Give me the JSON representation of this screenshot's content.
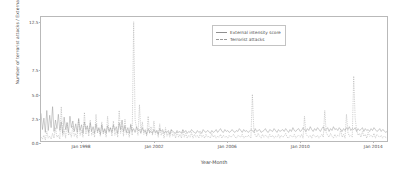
{
  "chart_data": {
    "type": "line",
    "title": "",
    "xlabel": "Year-Month",
    "ylabel": "Number of terrorist attacks / External intensity score",
    "ylim": [
      0.0,
      13.0
    ],
    "yticks": [
      "0.0",
      "2.5",
      "5.0",
      "7.5",
      "12.5"
    ],
    "ytick_values": [
      0.0,
      2.5,
      5.0,
      7.5,
      12.5
    ],
    "xlim": [
      "Jan 1996",
      "Dec 2015"
    ],
    "xticks": [
      "Jan 1998",
      "Jan 2002",
      "Jan 2006",
      "Jan 2010",
      "Jan 2014"
    ],
    "xtick_positions": [
      0.115,
      0.325,
      0.535,
      0.745,
      0.955
    ],
    "grid": false,
    "legend_position": "upper right",
    "series": [
      {
        "name": "External intensity score",
        "style": "solid",
        "color": "#8f8f8f",
        "values": [
          2.9,
          1.2,
          2.4,
          0.9,
          3.2,
          1.1,
          2.7,
          1.4,
          3.6,
          1.0,
          2.2,
          1.3,
          2.8,
          1.1,
          2.0,
          0.8,
          2.5,
          1.2,
          1.9,
          0.9,
          2.6,
          1.4,
          2.1,
          1.0,
          1.8,
          0.9,
          2.3,
          1.1,
          1.7,
          0.8,
          2.0,
          1.2,
          1.6,
          0.9,
          1.9,
          1.0,
          1.5,
          0.8,
          1.8,
          1.0,
          1.4,
          0.7,
          1.7,
          0.9,
          1.3,
          0.8,
          1.6,
          1.0,
          1.4,
          0.9,
          1.7,
          1.1,
          1.5,
          0.8,
          1.9,
          1.2,
          2.2,
          1.0,
          1.6,
          0.9,
          1.4,
          0.8,
          1.7,
          1.0,
          1.3,
          0.9,
          1.5,
          1.1,
          1.2,
          0.8,
          1.4,
          1.0,
          1.1,
          0.7,
          1.3,
          0.9,
          1.0,
          0.8,
          1.2,
          0.9,
          1.1,
          0.7,
          1.3,
          1.0,
          1.2,
          0.8,
          1.0,
          0.9,
          1.1,
          0.7,
          1.2,
          1.0,
          0.9,
          0.8,
          1.1,
          0.9,
          1.0,
          0.8,
          1.2,
          0.9,
          1.1,
          0.8,
          1.0,
          0.9,
          1.2,
          1.0,
          0.9,
          0.8,
          1.1,
          0.9,
          1.0,
          0.8,
          1.2,
          1.0,
          0.9,
          1.1,
          1.0,
          0.8,
          1.1,
          0.9,
          1.0,
          1.2,
          0.9,
          1.1,
          1.3,
          1.0,
          0.9,
          1.2,
          1.0,
          1.1,
          0.9,
          1.0,
          1.2,
          1.0,
          0.9,
          1.1,
          1.0,
          1.3,
          1.1,
          0.9,
          1.2,
          1.0,
          1.1,
          0.9,
          1.0,
          1.2,
          1.1,
          0.9,
          1.3,
          1.0,
          1.1,
          1.2,
          0.9,
          1.0,
          1.1,
          1.3,
          1.0,
          0.9,
          1.2,
          1.1,
          1.0,
          1.3,
          1.1,
          0.9,
          1.2,
          1.0,
          1.1,
          1.2,
          1.0,
          1.3,
          1.1,
          0.9,
          1.2,
          1.0,
          1.4,
          1.1,
          1.0,
          1.2,
          1.3,
          1.0,
          1.1,
          1.4,
          1.2,
          1.0,
          1.3,
          1.1,
          1.5,
          1.2,
          1.0,
          1.3,
          1.1,
          1.4,
          1.2,
          1.0,
          1.3,
          1.5,
          1.1,
          1.2,
          1.4,
          1.0,
          1.3,
          1.1,
          1.5,
          1.2,
          1.3,
          1.1,
          1.4,
          1.2,
          1.0,
          1.3,
          1.1,
          1.4,
          1.2,
          1.5,
          1.1,
          1.3,
          1.2,
          1.4,
          1.0,
          1.3,
          1.1,
          1.2,
          1.4,
          1.0,
          1.3,
          1.1,
          1.2,
          1.0,
          1.3,
          1.1,
          1.4,
          1.2,
          1.0,
          1.1,
          1.3,
          1.0,
          1.2,
          1.1,
          0.9,
          1.0
        ]
      },
      {
        "name": "Terrorist attacks",
        "style": "dashed",
        "color": "#9a9a9a",
        "values": [
          0.4,
          0.2,
          0.6,
          0.1,
          1.0,
          0.3,
          0.5,
          0.2,
          0.8,
          0.3,
          1.4,
          0.4,
          0.6,
          0.2,
          3.6,
          0.5,
          1.2,
          0.3,
          2.0,
          0.6,
          0.9,
          0.4,
          1.6,
          0.5,
          0.8,
          0.3,
          2.4,
          0.6,
          1.1,
          0.4,
          3.0,
          0.7,
          1.5,
          0.5,
          2.2,
          0.6,
          1.0,
          0.4,
          2.8,
          0.8,
          1.3,
          0.5,
          2.0,
          0.7,
          1.2,
          0.4,
          2.6,
          0.9,
          1.4,
          0.5,
          2.1,
          0.6,
          1.1,
          0.4,
          3.2,
          0.8,
          1.6,
          0.5,
          2.3,
          0.7,
          1.0,
          0.4,
          1.8,
          0.6,
          12.5,
          2.2,
          1.4,
          0.6,
          3.8,
          1.0,
          2.0,
          0.7,
          1.2,
          0.5,
          2.6,
          0.8,
          1.5,
          0.6,
          2.1,
          0.7,
          1.1,
          0.4,
          1.8,
          0.6,
          1.0,
          0.3,
          1.4,
          0.5,
          0.9,
          0.4,
          1.2,
          0.5,
          0.8,
          0.3,
          1.0,
          0.4,
          0.7,
          0.3,
          1.1,
          0.4,
          0.8,
          0.3,
          0.6,
          0.4,
          0.9,
          0.3,
          0.7,
          0.4,
          0.6,
          0.3,
          0.8,
          0.4,
          0.6,
          0.3,
          0.7,
          0.4,
          0.5,
          0.3,
          0.8,
          0.4,
          0.6,
          0.3,
          0.5,
          0.4,
          0.7,
          0.3,
          0.6,
          0.4,
          0.5,
          0.3,
          0.6,
          0.4,
          0.5,
          0.7,
          0.4,
          0.3,
          0.6,
          0.5,
          0.4,
          0.7,
          0.3,
          0.5,
          0.4,
          0.6,
          0.5,
          0.3,
          4.9,
          1.2,
          0.6,
          0.4,
          0.8,
          0.5,
          0.3,
          0.7,
          0.4,
          0.6,
          0.5,
          0.3,
          0.7,
          0.4,
          0.6,
          0.3,
          0.5,
          0.4,
          0.7,
          0.3,
          0.6,
          0.4,
          0.5,
          0.8,
          0.4,
          0.3,
          0.6,
          0.5,
          0.4,
          0.7,
          0.3,
          0.5,
          0.6,
          0.4,
          0.7,
          0.3,
          2.6,
          0.8,
          0.5,
          0.4,
          0.6,
          0.3,
          0.7,
          0.5,
          0.4,
          0.6,
          0.3,
          0.5,
          0.7,
          0.4,
          3.2,
          0.9,
          0.6,
          0.4,
          0.8,
          0.5,
          0.3,
          0.7,
          0.4,
          0.6,
          0.5,
          1.2,
          0.4,
          0.7,
          0.3,
          2.8,
          0.9,
          0.5,
          0.6,
          0.4,
          6.8,
          2.4,
          1.2,
          0.6,
          0.8,
          0.4,
          1.0,
          0.5,
          0.7,
          0.3,
          0.9,
          0.5,
          0.6,
          0.4,
          0.8,
          0.3,
          0.7,
          0.5,
          0.4,
          0.6,
          0.3,
          0.5,
          0.4,
          0.3
        ]
      }
    ]
  }
}
